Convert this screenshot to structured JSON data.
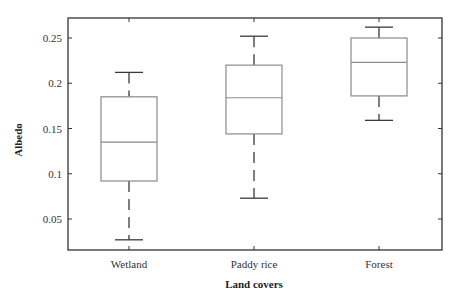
{
  "chart_data": {
    "type": "box",
    "title": "",
    "xlabel": "Land covers",
    "ylabel": "Albedo",
    "ylim": [
      0.0,
      0.27
    ],
    "yticks": [
      0.05,
      0.1,
      0.15,
      0.2,
      0.25
    ],
    "ytick_labels": [
      "0.05",
      "0.1",
      "0.15",
      "0.2",
      "0.25"
    ],
    "grid": false,
    "legend": null,
    "categories": [
      "Wetland",
      "Paddy rice",
      "Forest"
    ],
    "series": [
      {
        "name": "Wetland",
        "whisker_low": 0.027,
        "q1": 0.092,
        "median": 0.135,
        "q3": 0.185,
        "whisker_high": 0.212
      },
      {
        "name": "Paddy rice",
        "whisker_low": 0.073,
        "q1": 0.144,
        "median": 0.184,
        "q3": 0.22,
        "whisker_high": 0.252
      },
      {
        "name": "Forest",
        "whisker_low": 0.159,
        "q1": 0.186,
        "median": 0.223,
        "q3": 0.25,
        "whisker_high": 0.262
      }
    ],
    "colors": {
      "box": "#8a8a8a",
      "whisker": "#3a3a3a",
      "axis": "#333333"
    }
  }
}
